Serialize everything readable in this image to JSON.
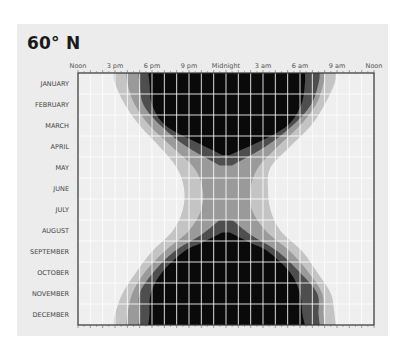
{
  "title": "60° N",
  "chart_data": {
    "type": "area",
    "title": "60° N",
    "x_ticks": [
      "Noon",
      "3 pm",
      "6 pm",
      "9 pm",
      "Midnight",
      "3 am",
      "6 am",
      "9 am",
      "Noon"
    ],
    "x_range_hours_from_midnight": [
      -12,
      12
    ],
    "categories": [
      "JANUARY",
      "FEBRUARY",
      "MARCH",
      "APRIL",
      "MAY",
      "JUNE",
      "JULY",
      "AUGUST",
      "SEPTEMBER",
      "OCTOBER",
      "NOVEMBER",
      "DECEMBER"
    ],
    "grid": true,
    "bands_note": "Each band lists [monthIndex(0=Jan top, 11.5=bottom edge), leftHours, rightHours] relative to midnight; outer to inner",
    "series": [
      {
        "name": "civil twilight",
        "color": "#c4c4c4",
        "points": [
          [
            -0.5,
            -9.1,
            8.9
          ],
          [
            0,
            -9.0,
            8.8
          ],
          [
            1,
            -8.2,
            8.0
          ],
          [
            2,
            -7.0,
            6.9
          ],
          [
            3,
            -5.4,
            5.2
          ],
          [
            4,
            -4.0,
            3.6
          ],
          [
            5,
            -3.4,
            3.4
          ],
          [
            6,
            -3.5,
            3.6
          ],
          [
            7,
            -4.3,
            4.4
          ],
          [
            8,
            -6.0,
            6.2
          ],
          [
            9,
            -7.3,
            7.4
          ],
          [
            10,
            -8.4,
            8.5
          ],
          [
            11,
            -9.0,
            8.8
          ],
          [
            11.5,
            -9.1,
            8.9
          ]
        ]
      },
      {
        "name": "nautical twilight",
        "color": "#9a9a9a",
        "points": [
          [
            -0.5,
            -8.1,
            8.0
          ],
          [
            0,
            -8.0,
            7.9
          ],
          [
            1,
            -7.4,
            7.3
          ],
          [
            2,
            -6.2,
            6.0
          ],
          [
            3,
            -4.4,
            4.2
          ],
          [
            4,
            -2.6,
            2.6
          ],
          [
            5,
            -1.9,
            2.0
          ],
          [
            6,
            -2.0,
            2.1
          ],
          [
            7,
            -3.0,
            3.2
          ],
          [
            8,
            -5.0,
            5.2
          ],
          [
            9,
            -6.6,
            6.7
          ],
          [
            10,
            -7.6,
            7.8
          ],
          [
            11,
            -8.0,
            7.9
          ],
          [
            11.5,
            -8.1,
            8.0
          ]
        ]
      },
      {
        "name": "astronomical twilight",
        "color": "#4e4e4e",
        "points": [
          [
            -0.5,
            -7.1,
            7.6
          ],
          [
            0,
            -7.0,
            7.5
          ],
          [
            1,
            -6.7,
            6.9
          ],
          [
            2,
            -5.3,
            5.4
          ],
          [
            3,
            -3.2,
            3.2
          ],
          [
            3.9,
            -0.5,
            0.5
          ],
          [
            6.5,
            -0.5,
            0.5
          ],
          [
            7.2,
            -2.0,
            2.0
          ],
          [
            8,
            -4.2,
            4.2
          ],
          [
            9,
            -5.9,
            6.0
          ],
          [
            10,
            -7.0,
            7.4
          ],
          [
            11,
            -7.0,
            7.5
          ],
          [
            11.5,
            -7.1,
            7.6
          ]
        ]
      },
      {
        "name": "night",
        "color": "#0a0a0a",
        "points": [
          [
            -0.5,
            -6.3,
            6.4
          ],
          [
            0,
            -6.2,
            6.4
          ],
          [
            1,
            -6.0,
            6.1
          ],
          [
            2,
            -4.9,
            5.0
          ],
          [
            2.8,
            -2.4,
            2.6
          ],
          [
            3.4,
            -0.3,
            0.3
          ],
          [
            7.1,
            -0.3,
            0.3
          ],
          [
            7.6,
            -2.0,
            2.0
          ],
          [
            8,
            -3.4,
            3.4
          ],
          [
            9,
            -5.2,
            5.2
          ],
          [
            10,
            -6.1,
            6.0
          ],
          [
            11,
            -6.2,
            6.2
          ],
          [
            11.5,
            -6.3,
            6.4
          ]
        ]
      }
    ],
    "background_color": "#efefef",
    "gridline_color": "#ffffff"
  }
}
